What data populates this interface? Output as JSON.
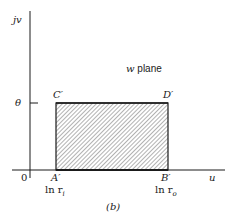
{
  "figure": {
    "caption": "(b)",
    "plane_label": "w plane",
    "axes": {
      "vertical_label": "jv",
      "horizontal_label": "u",
      "origin_label": "0",
      "theta_tick_label": "θ"
    },
    "region": {
      "corners": {
        "A": "A′",
        "B": "B′",
        "C": "C′",
        "D": "D′"
      },
      "fill": "hatched",
      "x_ticks": {
        "left": "ln r",
        "left_sub": "i",
        "right": "ln r",
        "right_sub": "o"
      }
    },
    "colors": {
      "ink": "#1a1a1a",
      "hatch": "#555555",
      "background": "#ffffff"
    }
  }
}
